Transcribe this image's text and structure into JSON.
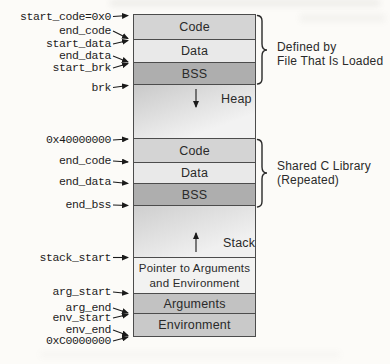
{
  "colors": {
    "background": "#fcfbf8",
    "segment_code": "#d4d4d4",
    "segment_data": "#e9e9e9",
    "segment_bss": "#aeaeae",
    "segment_pointer": "#f2f2f1",
    "segment_arguments": "#c2c2c2",
    "segment_environment": "#c9c9c9",
    "line": "#1a1a1a"
  },
  "memory_map": {
    "segments": [
      {
        "label": "Code"
      },
      {
        "label": "Data"
      },
      {
        "label": "BSS"
      },
      {
        "label": "Heap"
      },
      {
        "label": "Code"
      },
      {
        "label": "Data"
      },
      {
        "label": "BSS"
      },
      {
        "label": "Stack"
      },
      {
        "label": "Pointer to Arguments and Environment"
      },
      {
        "label": "Arguments"
      },
      {
        "label": "Environment"
      }
    ]
  },
  "address_labels": [
    {
      "text": "start_code=0x0"
    },
    {
      "text": "end_code"
    },
    {
      "text": "start_data"
    },
    {
      "text": "end_data"
    },
    {
      "text": "start_brk"
    },
    {
      "text": "brk"
    },
    {
      "text": "0x40000000"
    },
    {
      "text": "end_code"
    },
    {
      "text": "end_data"
    },
    {
      "text": "end_bss"
    },
    {
      "text": "stack_start"
    },
    {
      "text": "arg_start"
    },
    {
      "text": "arg_end"
    },
    {
      "text": "env_start"
    },
    {
      "text": "env_end"
    },
    {
      "text": "0xC0000000"
    }
  ],
  "annotations": [
    {
      "line1": "Defined by",
      "line2": "File That Is Loaded"
    },
    {
      "line1": "Shared C Library",
      "line2": "(Repeated)"
    }
  ]
}
